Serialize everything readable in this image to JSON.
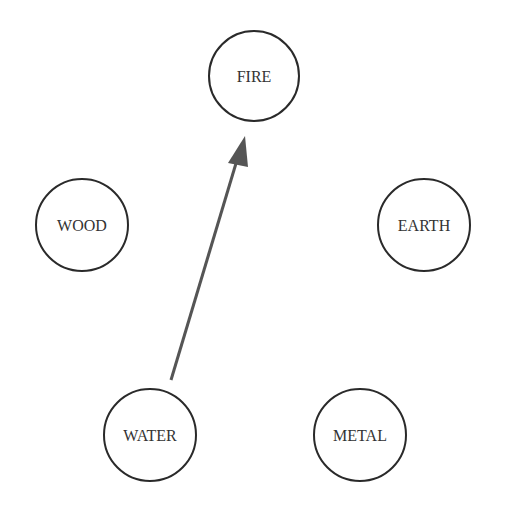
{
  "diagram": {
    "type": "five-elements-cycle",
    "nodes": [
      {
        "id": "fire",
        "label": "FIRE",
        "cx": 254,
        "cy": 76,
        "r": 45
      },
      {
        "id": "wood",
        "label": "WOOD",
        "cx": 82,
        "cy": 225,
        "r": 46
      },
      {
        "id": "earth",
        "label": "EARTH",
        "cx": 424,
        "cy": 225,
        "r": 46
      },
      {
        "id": "water",
        "label": "WATER",
        "cx": 150,
        "cy": 435,
        "r": 46
      },
      {
        "id": "metal",
        "label": "METAL",
        "cx": 360,
        "cy": 435,
        "r": 46
      }
    ],
    "edges": [
      {
        "from": "water",
        "to": "fire",
        "x1": 171,
        "y1": 380,
        "x2": 236,
        "y2": 160,
        "color": "#555555"
      }
    ]
  }
}
